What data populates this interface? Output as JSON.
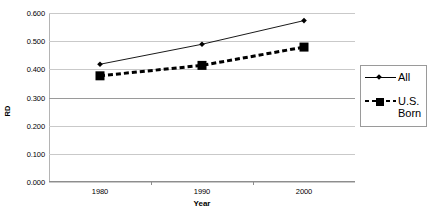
{
  "chart_data": {
    "type": "line",
    "title": "",
    "xlabel": "Year",
    "ylabel": "RD",
    "categories": [
      "1980",
      "1990",
      "2000"
    ],
    "x": [
      1980,
      1990,
      2000
    ],
    "series": [
      {
        "name": "All",
        "marker": "diamond",
        "linestyle": "solid",
        "color": "#000000",
        "values": [
          0.418,
          0.489,
          0.573
        ]
      },
      {
        "name": "U.S. Born",
        "marker": "square",
        "linestyle": "dashed",
        "color": "#000000",
        "values": [
          0.377,
          0.414,
          0.479
        ]
      }
    ],
    "ylim": [
      0.0,
      0.6
    ],
    "yticks": [
      "0.000",
      "0.100",
      "0.200",
      "0.300",
      "0.400",
      "0.500",
      "0.600"
    ],
    "ytick_values": [
      0.0,
      0.1,
      0.2,
      0.3,
      0.4,
      0.5,
      0.6
    ],
    "grid": true,
    "grid_axis": "y",
    "legend_position": "right"
  },
  "legend": {
    "entries": [
      {
        "label": "All"
      },
      {
        "label": "U.S.\nBorn"
      }
    ]
  },
  "axes": {
    "x_title": "Year",
    "y_title": "RD"
  }
}
